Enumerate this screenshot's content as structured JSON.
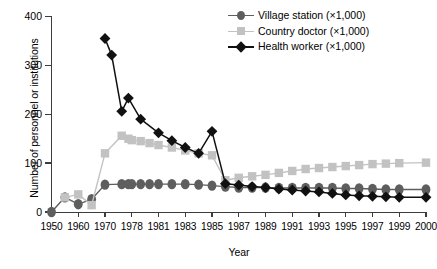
{
  "chart_data": {
    "type": "line",
    "title": "",
    "xlabel": "Year",
    "ylabel": "Number of personnel or institutions",
    "xlim": [
      1950,
      2000
    ],
    "ylim": [
      0,
      400
    ],
    "ytick_labels": [
      "0",
      "100",
      "200",
      "300",
      "400"
    ],
    "ytick_values": [
      0,
      100,
      200,
      300,
      400
    ],
    "xtick_labels": [
      "1950",
      "1960",
      "1970",
      "1978",
      "1981",
      "1983",
      "1985",
      "1987",
      "1989",
      "1991",
      "1993",
      "1995",
      "1997",
      "1999",
      "2000"
    ],
    "xtick_values": [
      1950,
      1960,
      1970,
      1978,
      1981,
      1983,
      1985,
      1987,
      1989,
      1991,
      1993,
      1995,
      1997,
      1999,
      2000
    ],
    "grid": false,
    "legend_position": "top-right",
    "series": [
      {
        "name": "Village station (×1,000)",
        "color": "#5e5e5e",
        "marker": "circle",
        "x": [
          1950,
          1955,
          1960,
          1965,
          1970,
          1975,
          1977,
          1978,
          1979,
          1980,
          1981,
          1982,
          1983,
          1984,
          1985,
          1986,
          1987,
          1988,
          1989,
          1990,
          1991,
          1992,
          1993,
          1994,
          1995,
          1996,
          1997,
          1998,
          1999,
          2000
        ],
        "values": [
          0,
          30,
          16,
          26,
          56,
          57,
          57,
          57,
          57,
          57,
          57,
          57,
          57,
          56,
          54,
          52,
          50,
          50,
          50,
          49,
          49,
          49,
          49,
          49,
          48,
          48,
          47,
          46,
          46,
          46
        ]
      },
      {
        "name": "Country doctor (×1,000)",
        "color": "#c2c2c2",
        "marker": "square",
        "x": [
          1955,
          1960,
          1965,
          1970,
          1975,
          1977,
          1978,
          1979,
          1980,
          1981,
          1982,
          1983,
          1984,
          1985,
          1986,
          1987,
          1988,
          1989,
          1990,
          1991,
          1992,
          1993,
          1994,
          1995,
          1996,
          1997,
          1998,
          1999,
          2000
        ],
        "values": [
          30,
          36,
          14,
          120,
          156,
          150,
          147,
          145,
          141,
          137,
          132,
          126,
          120,
          116,
          65,
          70,
          73,
          76,
          80,
          84,
          88,
          90,
          92,
          94,
          96,
          98,
          99,
          100,
          101
        ]
      },
      {
        "name": "Health worker (×1,000)",
        "color": "#111111",
        "marker": "diamond",
        "x": [
          1970,
          1972,
          1975,
          1977,
          1979,
          1981,
          1982,
          1983,
          1984,
          1985,
          1986,
          1987,
          1988,
          1989,
          1990,
          1991,
          1992,
          1993,
          1994,
          1995,
          1996,
          1997,
          1998,
          1999,
          2000
        ],
        "values": [
          355,
          321,
          206,
          233,
          190,
          162,
          146,
          132,
          120,
          165,
          58,
          55,
          52,
          50,
          47,
          45,
          43,
          41,
          38,
          35,
          33,
          32,
          31,
          30,
          30
        ]
      }
    ]
  },
  "legend": {
    "items": [
      {
        "label": "Village station (×1,000)",
        "color": "#5e5e5e",
        "marker": "circle"
      },
      {
        "label": "Country doctor (×1,000)",
        "color": "#c2c2c2",
        "marker": "square"
      },
      {
        "label": "Health worker (×1,000)",
        "color": "#111111",
        "marker": "diamond"
      }
    ]
  }
}
